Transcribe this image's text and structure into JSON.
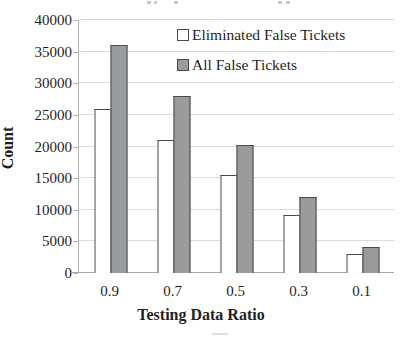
{
  "chart_data": {
    "type": "bar",
    "title": "",
    "categories": [
      "0.9",
      "0.7",
      "0.5",
      "0.3",
      "0.1"
    ],
    "series": [
      {
        "name": "Eliminated False Tickets",
        "color": "#ffffff",
        "values": [
          26000,
          21000,
          15500,
          9200,
          3000
        ]
      },
      {
        "name": "All False Tickets",
        "color": "#999b9d",
        "values": [
          36000,
          28000,
          20200,
          12000,
          4100
        ]
      }
    ],
    "xlabel": "Testing Data Ratio",
    "ylabel": "Count",
    "ylim": [
      0,
      40000
    ],
    "ytick_step": 5000,
    "y_tick_labels": [
      "0",
      "5000",
      "10000",
      "15000",
      "20000",
      "25000",
      "30000",
      "35000",
      "40000"
    ],
    "grid": "horizontal-only",
    "legend_position": "top-right-inside",
    "colors": {
      "grid": "#dcdcdc",
      "axis": "#b5b5b5",
      "bar_border": "#4a4a4a",
      "text": "#1f1f1f"
    }
  }
}
